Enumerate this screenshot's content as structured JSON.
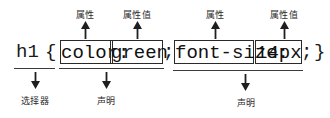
{
  "diagram": {
    "ink_color": "#1a1a1a",
    "background": "#ffffff",
    "code": {
      "selector": "h1",
      "open_brace": "{",
      "close_brace": "}",
      "declaration_1": {
        "property": "color:",
        "value": "green",
        "terminator": ";"
      },
      "declaration_2": {
        "property": "font-size:",
        "value": "14px",
        "terminator": ";"
      }
    },
    "labels": {
      "property_1": "属性",
      "property_value_1": "属性值",
      "property_2": "属性",
      "property_value_2": "属性值",
      "selector": "选择器",
      "declaration_1": "声明",
      "declaration_2": "声明"
    }
  }
}
